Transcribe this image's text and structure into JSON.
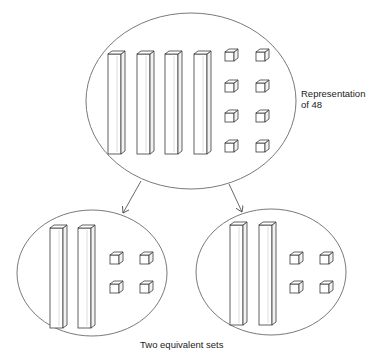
{
  "diagram": {
    "top_set": {
      "label_line1": "Representation",
      "label_line2": "of 48",
      "tens_rods": 4,
      "unit_cubes": 8,
      "value": 48
    },
    "bottom_sets": [
      {
        "name": "left-set",
        "tens_rods": 2,
        "unit_cubes": 4,
        "value": 24
      },
      {
        "name": "right-set",
        "tens_rods": 2,
        "unit_cubes": 4,
        "value": 24
      }
    ],
    "caption": "Two equivalent sets",
    "colors": {
      "stroke": "#3a3a3a",
      "background": "#ffffff",
      "text": "#222222"
    }
  }
}
